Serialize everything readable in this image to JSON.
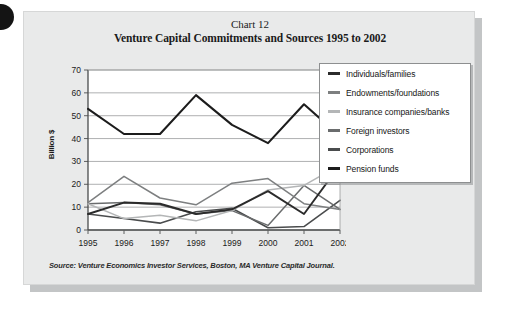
{
  "figure": {
    "chart_number": "Chart 12",
    "title": "Venture Capital Commitments and Sources 1995 to 2002",
    "source_note": "Source: Venture Economics Investor Services, Boston, MA Venture Capital Journal.",
    "axis_title": "Billion $",
    "background_color": "#e9eaea",
    "plot_background_color": "#ffffff",
    "shadow_color": "#c3c5c6"
  },
  "legend": {
    "position": "right",
    "items": [
      {
        "label": "Individuals/families",
        "color": "#2b2b2b"
      },
      {
        "label": "Endowments/foundations",
        "color": "#7d7f80"
      },
      {
        "label": "Insurance companies/banks",
        "color": "#b4b6b7"
      },
      {
        "label": "Foreign investors",
        "color": "#6a6c6d"
      },
      {
        "label": "Corporations",
        "color": "#4a4c4d"
      },
      {
        "label": "Pension funds",
        "color": "#1c1c1c"
      }
    ]
  },
  "chart_data": {
    "type": "line",
    "title": "Venture Capital Commitments and Sources 1995 to 2002",
    "subtitle": "Chart 12",
    "xlabel": "",
    "ylabel": "Billion $",
    "categories": [
      "1995",
      "1996",
      "1997",
      "1998",
      "1999",
      "2000",
      "2001",
      "2002"
    ],
    "ylim": [
      0,
      70
    ],
    "ytick_step": 10,
    "yticks": [
      0,
      10,
      20,
      30,
      40,
      50,
      60,
      70
    ],
    "grid": true,
    "legend_position": "right",
    "series": [
      {
        "name": "Pension funds",
        "color": "#1c1c1c",
        "width": 2.1,
        "values": [
          53,
          42,
          42,
          59,
          46,
          38,
          55,
          41
        ]
      },
      {
        "name": "Individuals/families",
        "color": "#2b2b2b",
        "width": 1.9,
        "values": [
          7,
          12,
          11.5,
          7,
          9,
          17,
          7,
          28.5
        ]
      },
      {
        "name": "Endowments/foundations",
        "color": "#7d7f80",
        "width": 1.5,
        "values": [
          12,
          23.5,
          14,
          11,
          20.5,
          22.5,
          11.5,
          9
        ]
      },
      {
        "name": "Insurance companies/banks",
        "color": "#b4b6b7",
        "width": 1.5,
        "values": [
          11.5,
          5,
          6.5,
          4,
          8.5,
          17.5,
          19.5,
          28.5
        ]
      },
      {
        "name": "Foreign investors",
        "color": "#6a6c6d",
        "width": 1.5,
        "values": [
          11.5,
          12,
          11,
          7,
          8.5,
          2,
          19.5,
          9
        ]
      },
      {
        "name": "Corporations",
        "color": "#4a4c4d",
        "width": 1.6,
        "values": [
          7,
          5,
          3,
          8,
          9.5,
          1,
          1.5,
          13
        ]
      }
    ]
  }
}
